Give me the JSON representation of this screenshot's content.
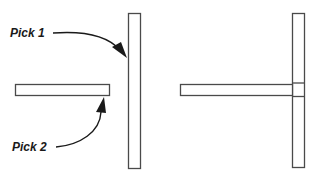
{
  "diagram": {
    "type": "extend-operation-illustration",
    "before": {
      "labels": {
        "pick1": "Pick 1",
        "pick2": "Pick 2"
      },
      "elements": [
        {
          "name": "boundary-edge",
          "orientation": "vertical",
          "picked_by": "Pick 1"
        },
        {
          "name": "object-to-extend",
          "orientation": "horizontal",
          "picked_by": "Pick 2"
        }
      ]
    },
    "after": {
      "elements": [
        {
          "name": "boundary-edge",
          "orientation": "vertical"
        },
        {
          "name": "extended-object",
          "orientation": "horizontal",
          "meets": "boundary-edge"
        }
      ]
    },
    "colors": {
      "stroke": "#4a4a4a",
      "text": "#1a1a1a",
      "background": "#ffffff"
    }
  }
}
